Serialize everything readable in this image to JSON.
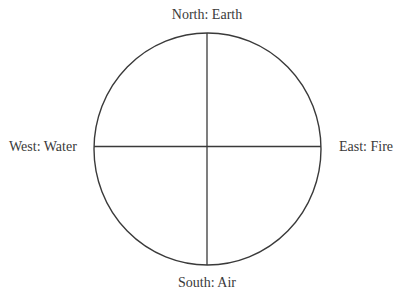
{
  "diagram": {
    "type": "four-directions-elements-circle",
    "line_color": "#3a3a3a",
    "labels": {
      "north": "North: Earth",
      "east": "East: Fire",
      "south": "South: Air",
      "west": "West: Water"
    }
  }
}
